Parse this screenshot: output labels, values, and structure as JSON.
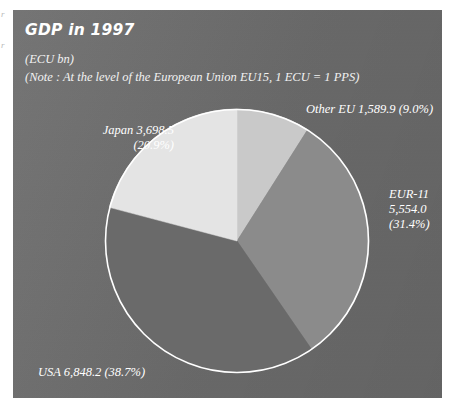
{
  "figure": {
    "title": "GDP in 1997",
    "units": "(ECU bn)",
    "note": "(Note : At the level of the European Union EU15, 1 ECU = 1 PPS)",
    "panel_color": "#6d6d6d",
    "text_color": "#ffffff"
  },
  "edge_marks": {
    "mark1": "r",
    "mark2": "r"
  },
  "labels": {
    "other_eu": "Other EU 1,589.9 (9.0%)",
    "japan_line1": "Japan 3,698.5",
    "japan_line2": "(20.9%)",
    "eur11_line1": "EUR-11",
    "eur11_line2": "5,554.0",
    "eur11_line3": "(31.4%)",
    "usa": "USA 6,848.2 (38.7%)"
  },
  "chart_data": {
    "type": "pie",
    "title": "GDP in 1997",
    "subtitle": "(ECU bn)",
    "annotation": "(Note : At the level of the European Union EU15, 1 ECU = 1 PPS)",
    "unit": "ECU bn",
    "start_angle_deg": 0,
    "direction": "clockwise",
    "legend_position": "outside-labels",
    "grid": false,
    "total": 17690.6,
    "categories": [
      "Other EU",
      "EUR-11",
      "USA",
      "Japan"
    ],
    "values": [
      1589.9,
      5554.0,
      6848.2,
      3698.5
    ],
    "percentages": [
      9.0,
      31.4,
      38.7,
      20.9
    ],
    "colors": [
      "#c9c9c9",
      "#8b8b8b",
      "#6a6a6a",
      "#e4e4e4"
    ],
    "slices": [
      {
        "name": "Other EU",
        "value": 1589.9,
        "percent": 9.0,
        "color": "#c9c9c9",
        "label": "Other EU 1,589.9 (9.0%)"
      },
      {
        "name": "EUR-11",
        "value": 5554.0,
        "percent": 31.4,
        "color": "#8b8b8b",
        "label": "EUR-11 5,554.0 (31.4%)"
      },
      {
        "name": "USA",
        "value": 6848.2,
        "percent": 38.7,
        "color": "#6a6a6a",
        "label": "USA 6,848.2 (38.7%)"
      },
      {
        "name": "Japan",
        "value": 3698.5,
        "percent": 20.9,
        "color": "#e4e4e4",
        "label": "Japan 3,698.5 (20.9%)"
      }
    ]
  }
}
